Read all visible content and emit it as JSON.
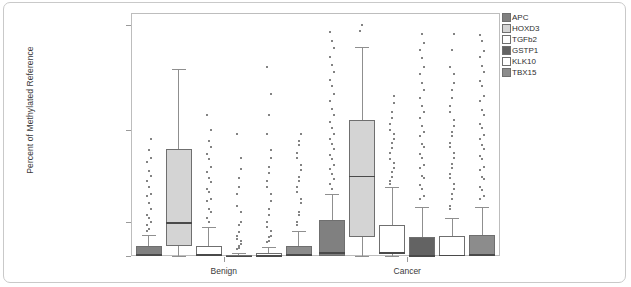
{
  "figure": {
    "y_axis_title": "Percent of Methylated Reference",
    "group_labels": [
      "Benign",
      "Cancer"
    ],
    "y_tick_labels": [
      "100",
      "10",
      "1",
      "0"
    ]
  },
  "legend": {
    "items": [
      {
        "label": "APC",
        "color": "#808080"
      },
      {
        "label": "HOXD3",
        "color": "#d4d4d4"
      },
      {
        "label": "TGFb2",
        "color": "#ffffff"
      },
      {
        "label": "GSTP1",
        "color": "#636363"
      },
      {
        "label": "KLK10",
        "color": "#ffffff"
      },
      {
        "label": "TBX15",
        "color": "#8c8c8c"
      }
    ]
  },
  "chart_data": {
    "type": "box",
    "title": "",
    "xlabel": "",
    "ylabel": "Percent of Methylated Reference",
    "yscale": "log-like",
    "ylim": [
      0,
      100
    ],
    "yticks": [
      0,
      1,
      10,
      100
    ],
    "grid": false,
    "legend_position": "top-right",
    "categories": [
      "Benign",
      "Cancer"
    ],
    "series": [
      {
        "name": "APC",
        "color": "#808080",
        "boxes": [
          {
            "group": "Benign",
            "whisker_low": 0.0,
            "q1": 0.0,
            "median": 0.05,
            "q3": 0.28,
            "whisker_high": 0.62,
            "outliers": [
              0.9,
              1.1,
              1.4,
              1.9,
              2.4,
              3.2,
              4.5,
              6.0,
              8.0,
              0.75,
              0.8,
              1.0,
              1.2,
              1.6,
              2.0,
              2.8,
              3.6,
              5.0
            ]
          },
          {
            "group": "Cancer",
            "whisker_low": 0.0,
            "q1": 0.0,
            "median": 0.12,
            "q3": 1.05,
            "whisker_high": 2.0,
            "outliers": [
              2.6,
              3.3,
              4.2,
              5.4,
              7.0,
              9.0,
              12.0,
              16.0,
              22.0,
              30.0,
              42.0,
              60.0,
              85.0,
              2.3,
              2.9,
              3.8,
              4.8,
              6.2,
              8.0,
              10.5,
              14.0,
              19.0,
              26.0,
              36.0,
              50.0,
              70.0
            ]
          }
        ]
      },
      {
        "name": "HOXD3",
        "color": "#d4d4d4",
        "boxes": [
          {
            "group": "Benign",
            "whisker_low": 0.0,
            "q1": 0.28,
            "median": 1.0,
            "q3": 6.2,
            "whisker_high": 38.0,
            "outliers": []
          },
          {
            "group": "Cancer",
            "whisker_low": 0.0,
            "q1": 0.55,
            "median": 3.2,
            "q3": 12.5,
            "whisker_high": 62.0,
            "outliers": [
              88.0,
              100.0
            ]
          }
        ]
      },
      {
        "name": "TGFb2",
        "color": "#ffffff",
        "boxes": [
          {
            "group": "Benign",
            "whisker_low": 0.0,
            "q1": 0.0,
            "median": 0.06,
            "q3": 0.3,
            "whisker_high": 0.85,
            "outliers": [
              1.1,
              1.4,
              1.8,
              2.3,
              3.0,
              4.0,
              5.5,
              7.5,
              10.0,
              14.0,
              1.0,
              1.3,
              1.7,
              2.1,
              2.7,
              3.5,
              4.8,
              6.5
            ]
          },
          {
            "group": "Cancer",
            "whisker_low": 0.0,
            "q1": 0.05,
            "median": 0.12,
            "q3": 0.9,
            "whisker_high": 2.4,
            "outliers": [
              2.8,
              3.5,
              4.4,
              5.6,
              7.2,
              9.0,
              11.5,
              15.0,
              21.0,
              2.6,
              3.1,
              3.9,
              4.9,
              6.3,
              8.0,
              10.0,
              13.0,
              18.0
            ]
          }
        ]
      },
      {
        "name": "GSTP1",
        "color": "#636363",
        "boxes": [
          {
            "group": "Benign",
            "whisker_low": 0.0,
            "q1": 0.0,
            "median": 0.01,
            "q3": 0.04,
            "whisker_high": 0.1,
            "outliers": [
              0.2,
              0.3,
              0.45,
              0.6,
              0.9,
              1.3,
              2.0,
              3.0,
              5.0,
              9.0,
              0.25,
              0.35,
              0.5,
              0.7,
              1.0,
              1.5,
              2.4,
              3.8
            ]
          },
          {
            "group": "Cancer",
            "whisker_low": 0.0,
            "q1": 0.0,
            "median": 0.03,
            "q3": 0.55,
            "whisker_high": 1.45,
            "outliers": [
              1.8,
              2.3,
              3.0,
              3.9,
              5.0,
              6.5,
              8.5,
              11.0,
              15.0,
              20.0,
              28.0,
              40.0,
              58.0,
              82.0,
              1.9,
              2.5,
              3.2,
              4.2,
              5.5,
              7.0,
              9.5,
              13.0,
              17.0,
              24.0,
              34.0,
              48.0,
              68.0
            ]
          }
        ]
      },
      {
        "name": "KLK10",
        "color": "#ffffff",
        "boxes": [
          {
            "group": "Benign",
            "whisker_low": 0.0,
            "q1": 0.0,
            "median": 0.02,
            "q3": 0.1,
            "whisker_high": 0.26,
            "outliers": [
              0.4,
              0.55,
              0.75,
              1.0,
              1.4,
              2.0,
              2.8,
              4.0,
              6.0,
              9.0,
              14.0,
              22.0,
              40.0,
              0.45,
              0.6,
              0.85,
              1.2,
              1.7,
              2.4,
              3.4,
              5.0
            ]
          },
          {
            "group": "Cancer",
            "whisker_low": 0.0,
            "q1": 0.0,
            "median": 0.04,
            "q3": 0.6,
            "whisker_high": 1.1,
            "outliers": [
              1.4,
              1.8,
              2.3,
              3.0,
              3.9,
              5.0,
              6.5,
              8.5,
              11.0,
              15.0,
              20.0,
              28.0,
              40.0,
              58.0,
              82.0,
              1.5,
              2.0,
              2.6,
              3.3,
              4.3,
              5.6,
              7.2,
              9.5,
              12.5,
              17.0,
              24.0,
              34.0
            ]
          }
        ]
      },
      {
        "name": "TBX15",
        "color": "#8c8c8c",
        "boxes": [
          {
            "group": "Benign",
            "whisker_low": 0.0,
            "q1": 0.0,
            "median": 0.05,
            "q3": 0.3,
            "whisker_high": 0.75,
            "outliers": [
              0.9,
              1.2,
              1.6,
              2.1,
              2.8,
              3.7,
              5.0,
              6.8,
              9.0,
              1.0,
              1.3,
              1.8,
              2.4,
              3.1,
              4.2,
              5.6,
              7.5
            ]
          },
          {
            "group": "Cancer",
            "whisker_low": 0.0,
            "q1": 0.0,
            "median": 0.05,
            "q3": 0.62,
            "whisker_high": 1.45,
            "outliers": [
              1.8,
              2.2,
              2.9,
              3.7,
              4.8,
              6.2,
              8.0,
              10.5,
              14.0,
              19.0,
              26.0,
              36.0,
              50.0,
              70.0,
              1.9,
              2.4,
              3.1,
              4.0,
              5.2,
              6.8,
              8.8,
              11.5,
              15.5,
              21.0,
              29.0,
              41.0,
              57.0,
              80.0
            ]
          }
        ]
      }
    ]
  }
}
